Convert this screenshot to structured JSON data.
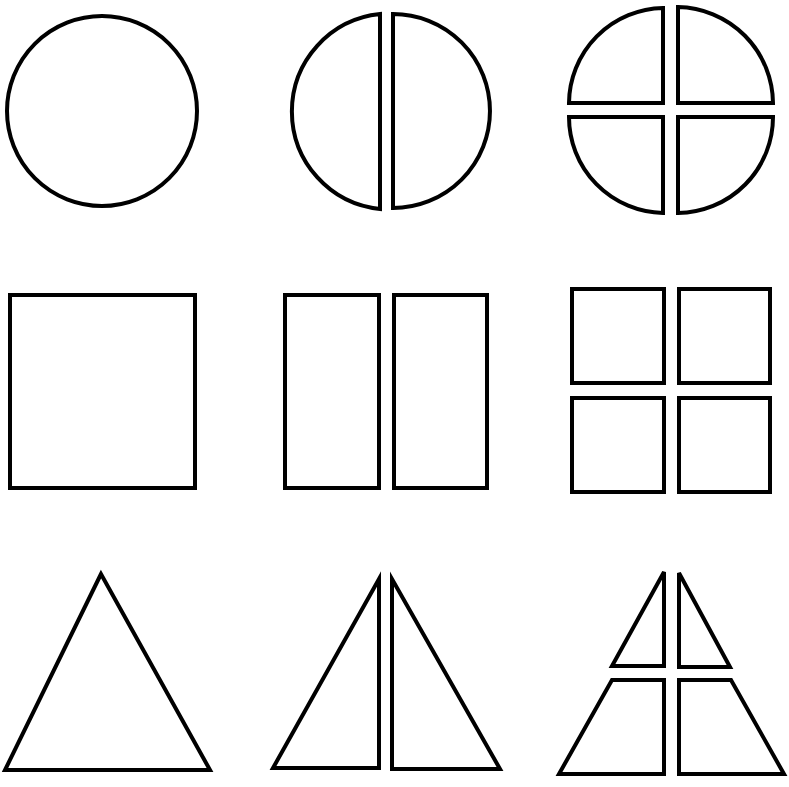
{
  "diagram": {
    "description": "Fractions of shapes: whole, halves, quarters",
    "stroke_color": "#000000",
    "fill_color": "#ffffff",
    "background": "#ffffff",
    "rows": [
      {
        "shape": "circle",
        "figures": [
          {
            "name": "whole-circle",
            "parts": 1,
            "label": "circle whole"
          },
          {
            "name": "circle-halves",
            "parts": 2,
            "label": "circle halves"
          },
          {
            "name": "circle-quarters",
            "parts": 4,
            "label": "circle quarters"
          }
        ]
      },
      {
        "shape": "square",
        "figures": [
          {
            "name": "whole-square",
            "parts": 1,
            "label": "square whole"
          },
          {
            "name": "square-halves",
            "parts": 2,
            "label": "square halves"
          },
          {
            "name": "square-quarters",
            "parts": 4,
            "label": "square quarters"
          }
        ]
      },
      {
        "shape": "triangle",
        "figures": [
          {
            "name": "whole-triangle",
            "parts": 1,
            "label": "triangle whole"
          },
          {
            "name": "triangle-halves",
            "parts": 2,
            "label": "triangle halves"
          },
          {
            "name": "triangle-quarters",
            "parts": 4,
            "label": "triangle quarters"
          }
        ]
      }
    ]
  }
}
